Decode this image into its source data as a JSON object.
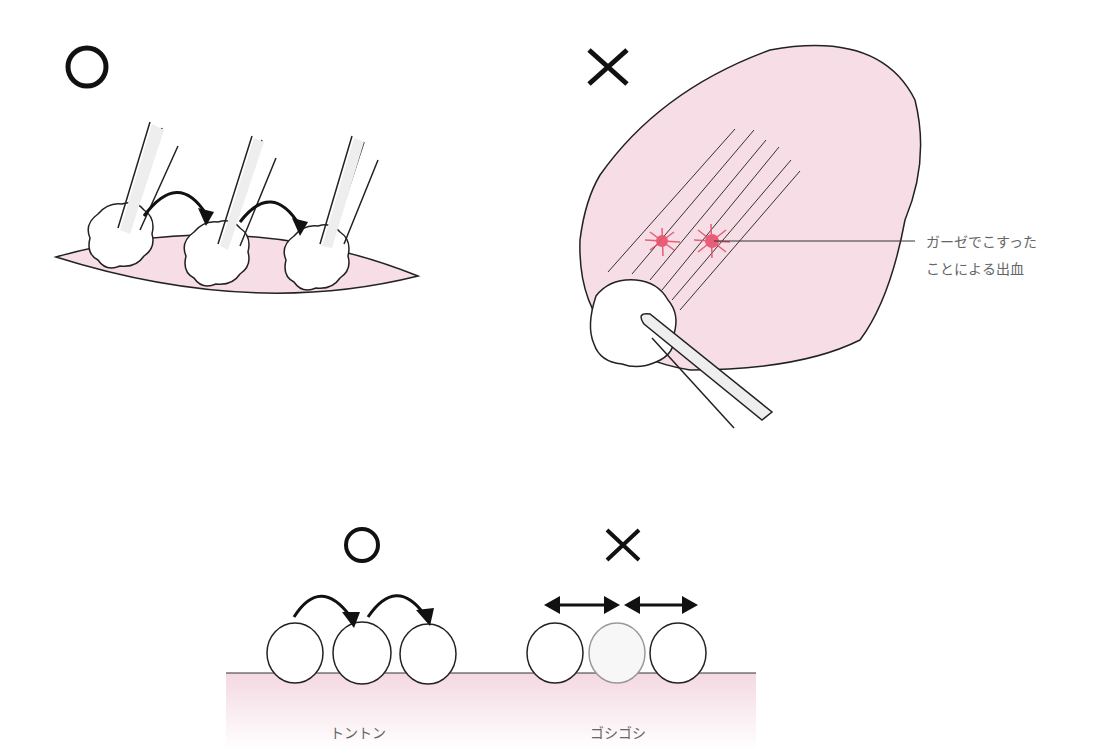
{
  "panels": {
    "top_left": {
      "mark": "○",
      "meaning": "correct"
    },
    "top_right": {
      "mark": "×",
      "meaning": "incorrect",
      "callout": {
        "line1": "ガーゼでこすった",
        "line2": "ことによる出血"
      }
    },
    "bottom": {
      "left": {
        "mark": "○",
        "label": "トントン"
      },
      "right": {
        "mark": "×",
        "label": "ゴシゴシ"
      }
    }
  },
  "colors": {
    "tissue_pink": "#f6dde6",
    "tissue_pink_light": "#fbeef3",
    "blood_red": "#e8506a",
    "stroke": "#1a1a1a",
    "label_gray": "#666666"
  }
}
